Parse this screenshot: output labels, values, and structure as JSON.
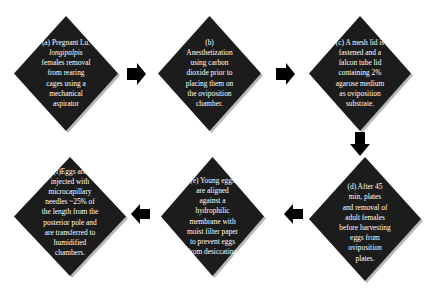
{
  "diagram": {
    "type": "flowchart",
    "steps": [
      {
        "id": "a",
        "lines": [
          "(a) Pregnant  Lu.",
          "longipalpis",
          "females  removal",
          "from rearing",
          "cages using a",
          "mechanical",
          "aspirator"
        ]
      },
      {
        "id": "b",
        "lines": [
          "(b)",
          "Anesthetization",
          "using carbon",
          "dioxide prior to",
          "placing them on",
          "the oviposition",
          "chamber."
        ]
      },
      {
        "id": "c",
        "lines": [
          "(c) A mesh lid is",
          "fastened and a",
          "falcon tube lid",
          "containing 2%",
          "agarose medium",
          "as oviposition",
          "substrate."
        ]
      },
      {
        "id": "d",
        "lines": [
          "(d) After 45",
          "min, plates",
          "and removal of",
          "adult females",
          "before harvesting",
          "eggs from",
          "oviposition",
          "plates."
        ]
      },
      {
        "id": "e",
        "lines": [
          "(e) Young eggs",
          "are aligned",
          "against a",
          "hydrophilic",
          "membrane with",
          "moist filter paper",
          "to prevent eggs",
          "from desiccating"
        ]
      },
      {
        "id": "f",
        "lines": [
          "(f)Eggs are",
          "injected with",
          "microcapillary",
          "needles ~25% of",
          "the length from the",
          "posterior pole and",
          "are transferred to",
          "humidified",
          "chambers."
        ]
      }
    ],
    "arrows": [
      {
        "from": "a",
        "to": "b",
        "direction": "right"
      },
      {
        "from": "b",
        "to": "c",
        "direction": "right"
      },
      {
        "from": "c",
        "to": "d",
        "direction": "down"
      },
      {
        "from": "d",
        "to": "e",
        "direction": "left"
      },
      {
        "from": "e",
        "to": "f",
        "direction": "left"
      }
    ],
    "colors": {
      "diamond_fill": "#1c1c1c",
      "diamond_text": "#ffffff",
      "arrow_fill": "#000000",
      "background": "#ffffff"
    }
  }
}
